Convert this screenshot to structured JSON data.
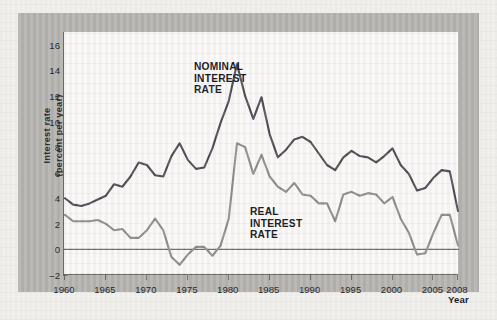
{
  "chart_data": {
    "type": "line",
    "title": "",
    "xlabel": "Year",
    "ylabel": "Interest rate (percent per year)",
    "xlim": [
      1960,
      2008
    ],
    "ylim": [
      -2,
      17
    ],
    "grid": false,
    "legend": "inline-annotations",
    "xticks": [
      1960,
      1965,
      1970,
      1975,
      1980,
      1985,
      1990,
      1995,
      2000,
      2005,
      2008
    ],
    "xtick_labels": [
      "1960",
      "1965",
      "1970",
      "1975",
      "1980",
      "1985",
      "1990",
      "1995",
      "2000",
      "2005",
      "2008"
    ],
    "yticks": [
      -2,
      0,
      2,
      4,
      6,
      8,
      10,
      12,
      14,
      16
    ],
    "ytick_labels": [
      "–2",
      "0",
      "2",
      "4",
      "6",
      "8",
      "10",
      "12",
      "14",
      "16"
    ],
    "zero_line": 0,
    "x": [
      1960,
      1961,
      1962,
      1963,
      1964,
      1965,
      1966,
      1967,
      1968,
      1969,
      1970,
      1971,
      1972,
      1973,
      1974,
      1975,
      1976,
      1977,
      1978,
      1979,
      1980,
      1981,
      1982,
      1983,
      1984,
      1985,
      1986,
      1987,
      1988,
      1989,
      1990,
      1991,
      1992,
      1993,
      1994,
      1995,
      1996,
      1997,
      1998,
      1999,
      2000,
      2001,
      2002,
      2003,
      2004,
      2005,
      2006,
      2007,
      2008
    ],
    "series": [
      {
        "name": "NOMINAL INTEREST RATE",
        "label_lines": [
          "NOMINAL",
          "INTEREST",
          "RATE"
        ],
        "color": "#4d4d55",
        "width": 2.1,
        "values": [
          4.0,
          3.5,
          3.4,
          3.6,
          3.9,
          4.2,
          5.1,
          4.9,
          5.7,
          6.8,
          6.6,
          5.8,
          5.7,
          7.3,
          8.3,
          7.0,
          6.3,
          6.4,
          7.9,
          9.9,
          11.6,
          14.5,
          12.0,
          10.2,
          11.9,
          9.0,
          7.2,
          7.8,
          8.6,
          8.8,
          8.4,
          7.5,
          6.6,
          6.2,
          7.2,
          7.7,
          7.3,
          7.2,
          6.8,
          7.3,
          7.9,
          6.6,
          5.9,
          4.6,
          4.8,
          5.6,
          6.2,
          6.1,
          3.0
        ]
      },
      {
        "name": "REAL INTEREST RATE",
        "label_lines": [
          "REAL",
          "INTEREST",
          "RATE"
        ],
        "color": "#8e8d8b",
        "width": 2.1,
        "values": [
          2.7,
          2.2,
          2.2,
          2.2,
          2.3,
          2.0,
          1.5,
          1.6,
          0.9,
          0.9,
          1.5,
          2.4,
          1.5,
          -0.6,
          -1.2,
          -0.4,
          0.2,
          0.2,
          -0.5,
          0.3,
          2.4,
          8.3,
          8.0,
          5.9,
          7.4,
          5.7,
          4.9,
          4.5,
          5.2,
          4.3,
          4.2,
          3.6,
          3.6,
          2.2,
          4.3,
          4.5,
          4.2,
          4.4,
          4.3,
          3.6,
          4.1,
          2.4,
          1.3,
          -0.4,
          -0.3,
          1.3,
          2.7,
          2.7,
          0.3
        ]
      }
    ],
    "annotations": [
      {
        "text": "NOMINAL INTEREST RATE",
        "x": 1977,
        "y": 13.5
      },
      {
        "text": "REAL INTEREST RATE",
        "x": 1986,
        "y": 3.2
      }
    ]
  },
  "axis": {
    "y_title": "Interest rate\n(percent per year)",
    "y_title_line1": "Interest rate",
    "y_title_line2": "(percent per year)",
    "x_title": "Year"
  },
  "colors": {
    "nominal": "#4d4d55",
    "real": "#8e8d8b",
    "axis": "#6e6c6a",
    "frame": "#b6b4b1",
    "plot_bg": "#faf9f7",
    "page_bg": "#f1efeb",
    "text": "#26262a"
  }
}
